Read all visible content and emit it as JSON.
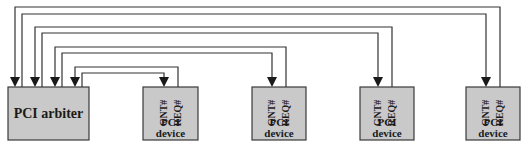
{
  "diagram": {
    "arbiter": {
      "label": "PCI arbiter"
    },
    "devices": [
      {
        "gnt_label": "GNT#",
        "req_label": "REQ#",
        "line1": "PCI",
        "line2": "device"
      },
      {
        "gnt_label": "GNT#",
        "req_label": "REQ#",
        "line1": "PCI",
        "line2": "device"
      },
      {
        "gnt_label": "GNT#",
        "req_label": "REQ#",
        "line1": "PCI",
        "line2": "device"
      },
      {
        "gnt_label": "GNT#",
        "req_label": "REQ#",
        "line1": "PCI",
        "line2": "device"
      }
    ],
    "colors": {
      "box_fill": "#c9c9c9",
      "stroke": "#333333"
    }
  }
}
